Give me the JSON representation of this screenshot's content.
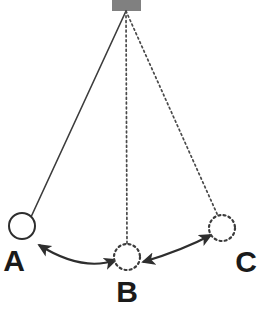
{
  "diagram": {
    "background_color": "#ffffff",
    "line_color": "#3c3c3c",
    "label_color": "#1a1a1a",
    "anchor": {
      "name": "ceiling-mount",
      "color": "#808080",
      "x": 112,
      "y": 0,
      "width": 29,
      "height": 11,
      "pivot_x": 126,
      "pivot_y": 11
    },
    "strings": [
      {
        "id": "string-a",
        "label": "A",
        "style": "solid",
        "from_x": 126,
        "from_y": 11,
        "to_x": 31,
        "to_y": 217
      },
      {
        "id": "string-b",
        "label": "B",
        "style": "dotted",
        "from_x": 126,
        "from_y": 11,
        "to_x": 127,
        "to_y": 244
      },
      {
        "id": "string-c",
        "label": "C",
        "style": "dotted",
        "from_x": 126,
        "from_y": 11,
        "to_x": 218,
        "to_y": 216
      }
    ],
    "bobs": [
      {
        "id": "bob-a",
        "label": "A",
        "style": "solid",
        "cx": 22,
        "cy": 226,
        "r": 13,
        "label_x": 14,
        "label_y": 271
      },
      {
        "id": "bob-b",
        "label": "B",
        "style": "dotted",
        "cx": 127,
        "cy": 257,
        "r": 13,
        "label_x": 127,
        "label_y": 302
      },
      {
        "id": "bob-c",
        "label": "C",
        "style": "dotted",
        "cx": 222,
        "cy": 228,
        "r": 13,
        "label_x": 246,
        "label_y": 272
      }
    ],
    "arrows": [
      {
        "id": "arrow-a-b",
        "from": "A",
        "to": "B",
        "double_headed": true,
        "path": "M 39 245 Q 82 272 116 260"
      },
      {
        "id": "arrow-b-c",
        "from": "B",
        "to": "C",
        "double_headed": true,
        "path": "M 143 262 Q 183 250 211 235"
      }
    ]
  }
}
